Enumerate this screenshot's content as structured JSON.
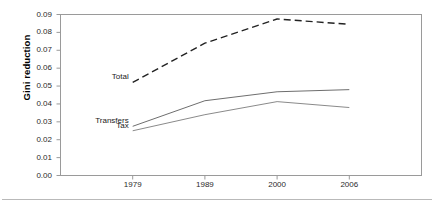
{
  "chart_data": {
    "type": "line",
    "title": "",
    "xlabel": "",
    "ylabel": "Gini reduction",
    "categories": [
      "1979",
      "1989",
      "2000",
      "2006"
    ],
    "ylim": [
      0.0,
      0.09
    ],
    "ytick_labels": [
      "0.09",
      "0.08",
      "0.07",
      "0.06",
      "0.05",
      "0.04",
      "0.03",
      "0.02",
      "0.01",
      "0.00"
    ],
    "ytick_values": [
      0.09,
      0.08,
      0.07,
      0.06,
      0.05,
      0.04,
      0.03,
      0.02,
      0.01,
      0.0
    ],
    "grid": false,
    "legend": "inline-labels",
    "series": [
      {
        "name": "Total",
        "style": "dashed",
        "color": "#222222",
        "values": [
          0.052,
          0.074,
          0.0875,
          0.0845
        ]
      },
      {
        "name": "Transfers",
        "style": "solid",
        "color": "#6e6e6e",
        "values": [
          0.0275,
          0.0418,
          0.0468,
          0.048
        ]
      },
      {
        "name": "Tax",
        "style": "solid",
        "color": "#8a8a8a",
        "values": [
          0.025,
          0.034,
          0.0413,
          0.038
        ]
      }
    ],
    "annotations": [
      {
        "text": "Total",
        "series": "Total"
      },
      {
        "text": "Transfers",
        "series": "Transfers"
      },
      {
        "text": "Tax",
        "series": "Tax"
      }
    ]
  },
  "axis": {
    "y_title": "Gini reduction"
  }
}
